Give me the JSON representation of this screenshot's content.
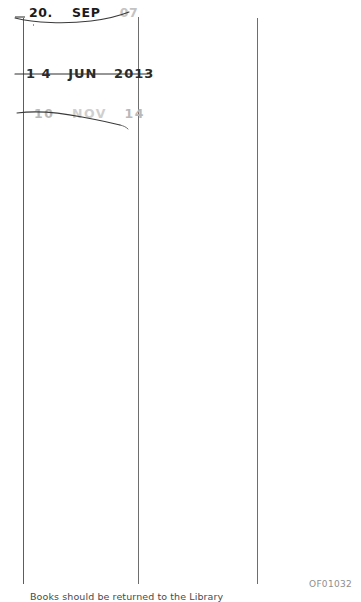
{
  "document": {
    "kind": "library-date-due-slip",
    "background_color": "#ffffff",
    "rule_color": "#5d5d5d"
  },
  "stamps": [
    {
      "id": "stamp-1",
      "day": "20.",
      "month": "SEP",
      "year": "07",
      "full_text": "20. SEP 07",
      "ink": "#1b1b1b",
      "year_ink": "#c3c3c3",
      "cancelled": true
    },
    {
      "id": "stamp-2",
      "day": "1 4",
      "month": "JUN",
      "year": "2013",
      "full_text": "1 4 JUN 2013",
      "ink": "#2a2a2a",
      "cancelled": true
    },
    {
      "id": "stamp-3",
      "day": "10",
      "month": "NOV",
      "year": "14",
      "full_text": "10 NOV 14",
      "ink": "#b9b9b9",
      "cancelled": true
    }
  ],
  "footer": {
    "note": "Books should be returned to the Library",
    "reference_code": "OF01032"
  },
  "rules": {
    "left_label": "column-rule-left",
    "middle_label": "column-rule-middle",
    "right_label": "column-rule-right"
  }
}
